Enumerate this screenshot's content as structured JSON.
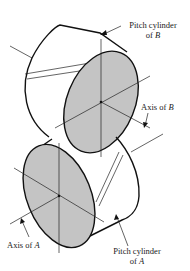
{
  "figure": {
    "type": "gear pitch cylinders diagram (crossed helical gears)",
    "colors": {
      "line": "#111111",
      "face_fill": "#c4c4c4",
      "background": "#ffffff"
    }
  },
  "labels": {
    "pitch_cylinder_b": {
      "line1": "Pitch cylinder",
      "line2_prefix": "of ",
      "line2_var": "B"
    },
    "axis_b": {
      "prefix": "Axis of ",
      "var": "B"
    },
    "axis_a": {
      "prefix": "Axis of ",
      "var": "A"
    },
    "pitch_cylinder_a": {
      "line1": "Pitch cylinder",
      "line2_prefix": "of ",
      "line2_var": "A"
    }
  }
}
